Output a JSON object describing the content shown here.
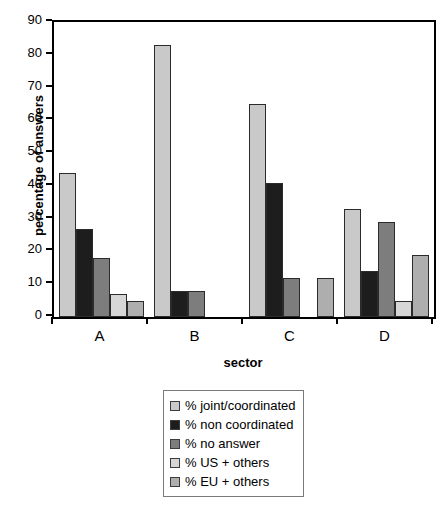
{
  "chart_data": {
    "type": "bar",
    "title": "",
    "xlabel": "sector",
    "ylabel": "percentage of answers",
    "categories": [
      "A",
      "B",
      "C",
      "D"
    ],
    "ylim": [
      0,
      90
    ],
    "yticks": [
      0,
      10,
      20,
      30,
      40,
      50,
      60,
      70,
      80,
      90
    ],
    "grid": false,
    "legend_position": "bottom",
    "series": [
      {
        "name": "% joint/coordinated",
        "color": "#c9c9c9",
        "values": [
          44,
          83,
          65,
          33
        ]
      },
      {
        "name": "% non coordinated",
        "color": "#1d1d1d",
        "values": [
          27,
          8,
          41,
          14
        ]
      },
      {
        "name": "% no answer",
        "color": "#7d7d7d",
        "values": [
          18,
          8,
          12,
          29
        ]
      },
      {
        "name": "% US + others",
        "color": "#d6d6d6",
        "values": [
          7,
          0,
          0,
          5
        ]
      },
      {
        "name": "% EU + others",
        "color": "#aeaeae",
        "values": [
          5,
          0,
          12,
          19
        ]
      }
    ]
  },
  "axes": {
    "y_title": "percentage of answers",
    "x_title": "sector",
    "y_tick_labels": [
      "0",
      "10",
      "20",
      "30",
      "40",
      "50",
      "60",
      "70",
      "80",
      "90"
    ],
    "x_group_labels": [
      "A",
      "B",
      "C",
      "D"
    ]
  },
  "legend": {
    "entries": [
      {
        "label": "% joint/coordinated",
        "color": "#c9c9c9"
      },
      {
        "label": "% non coordinated",
        "color": "#1d1d1d"
      },
      {
        "label": "% no answer",
        "color": "#7d7d7d"
      },
      {
        "label": "% US + others",
        "color": "#d6d6d6"
      },
      {
        "label": "% EU + others",
        "color": "#aeaeae"
      }
    ]
  }
}
